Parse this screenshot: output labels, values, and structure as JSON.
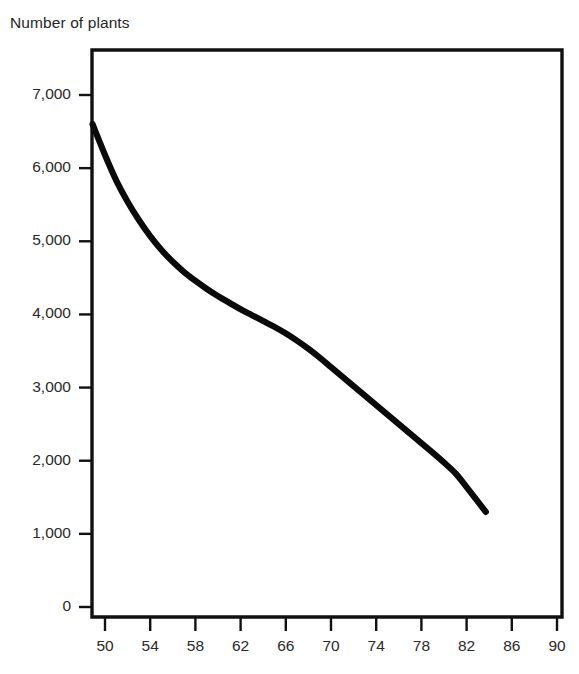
{
  "chart_data": {
    "type": "line",
    "title": "Number of plants",
    "xlabel": "",
    "ylabel": "Number of plants",
    "xlim": [
      48,
      91
    ],
    "ylim": [
      0,
      7500
    ],
    "grid": false,
    "legend": null,
    "y_ticks": [
      "0",
      "1,000",
      "2,000",
      "3,000",
      "4,000",
      "5,000",
      "6,000",
      "7,000"
    ],
    "y_tick_values": [
      0,
      1000,
      2000,
      3000,
      4000,
      5000,
      6000,
      7000
    ],
    "x_ticks": [
      "50",
      "54",
      "58",
      "62",
      "66",
      "70",
      "74",
      "78",
      "82",
      "86",
      "90"
    ],
    "x_tick_values": [
      50,
      54,
      58,
      62,
      66,
      70,
      74,
      78,
      82,
      86,
      90
    ],
    "series": [
      {
        "name": "Number of plants",
        "color": "#0a0a0a",
        "x": [
          48.9,
          50,
          51,
          52,
          53,
          54,
          55,
          56,
          57,
          58,
          59,
          60,
          61,
          62,
          63,
          64,
          65,
          66,
          67,
          68,
          69,
          70,
          71,
          72,
          73,
          74,
          75,
          76,
          77,
          78,
          79,
          80,
          81,
          82,
          83.7
        ],
        "values": [
          6600,
          6180,
          5830,
          5540,
          5290,
          5070,
          4880,
          4720,
          4580,
          4460,
          4350,
          4250,
          4160,
          4070,
          3990,
          3910,
          3830,
          3740,
          3640,
          3530,
          3410,
          3280,
          3150,
          3020,
          2890,
          2760,
          2630,
          2500,
          2370,
          2240,
          2110,
          1975,
          1830,
          1640,
          1300
        ]
      }
    ],
    "annotations": []
  },
  "colors": {
    "curve": "#0a0a0a",
    "frame": "#111111",
    "text": "#2a2a2a",
    "background": "#ffffff"
  },
  "artifacts": {
    "bottom_smudge": ""
  }
}
